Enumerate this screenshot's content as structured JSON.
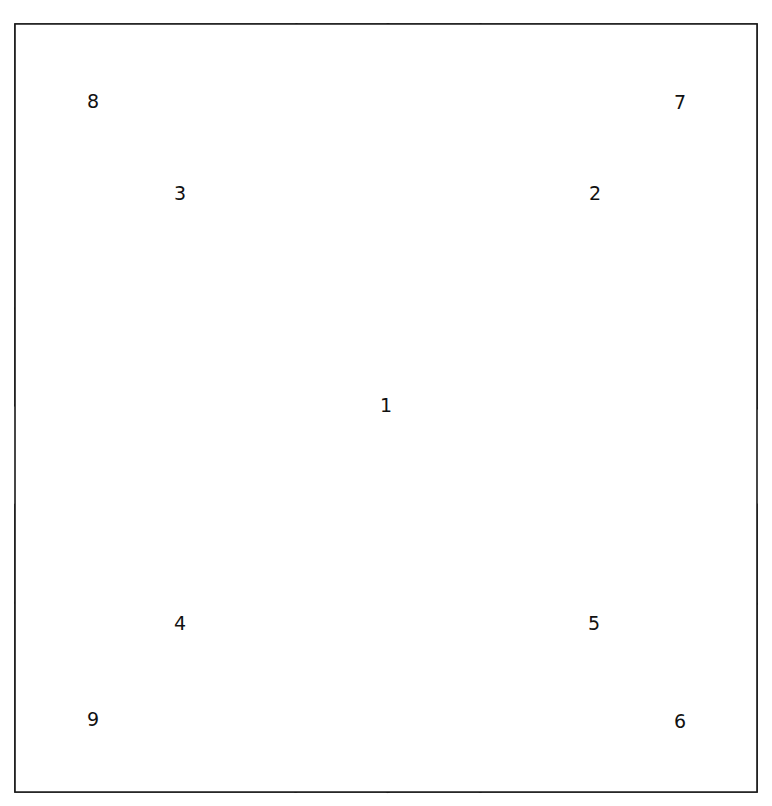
{
  "figure": {
    "canvas": {
      "width": 772,
      "height": 806
    },
    "stroke_color": "#1a1a1a",
    "fill_color": "#ffffff",
    "label_color": "#111111",
    "outer_square": {
      "name": "outer-square",
      "left": 15,
      "top": 24,
      "right": 757,
      "bottom": 792
    },
    "regions": [
      {
        "id": "region-1",
        "label": "1",
        "description": "central inscribed diamond",
        "points": "388,24 757,408 388,792 15,405",
        "label_x": 386,
        "label_y": 406
      },
      {
        "id": "region-2",
        "label": "2",
        "description": "upper-right band",
        "points": "388,24 481,24 757,310 757,408",
        "label_x": 595,
        "label_y": 194
      },
      {
        "id": "region-3",
        "label": "3",
        "description": "upper-left band",
        "points": "296,24 388,24 15,405 15,308",
        "label_x": 180,
        "label_y": 194
      },
      {
        "id": "region-4",
        "label": "4",
        "description": "lower-left band",
        "points": "15,505 388,792 295,792 15,603",
        "label_x": 180,
        "label_y": 624
      },
      {
        "id": "region-5",
        "label": "5",
        "description": "lower-right band",
        "points": "757,505 757,604 481,792 388,792",
        "label_x": 594,
        "label_y": 624
      },
      {
        "id": "region-6",
        "label": "6",
        "description": "bottom-right corner triangle",
        "points": "757,604 757,792 481,792",
        "label_x": 680,
        "label_y": 722
      },
      {
        "id": "region-7",
        "label": "7",
        "description": "top-right corner triangle",
        "points": "481,24 757,24 757,310",
        "label_x": 680,
        "label_y": 103
      },
      {
        "id": "region-8",
        "label": "8",
        "description": "top-left corner triangle",
        "points": "15,24 296,24 15,308",
        "label_x": 93,
        "label_y": 102
      },
      {
        "id": "region-9",
        "label": "9",
        "description": "bottom-left corner triangle",
        "points": "15,603 295,792 15,792",
        "label_x": 93,
        "label_y": 720
      }
    ]
  }
}
